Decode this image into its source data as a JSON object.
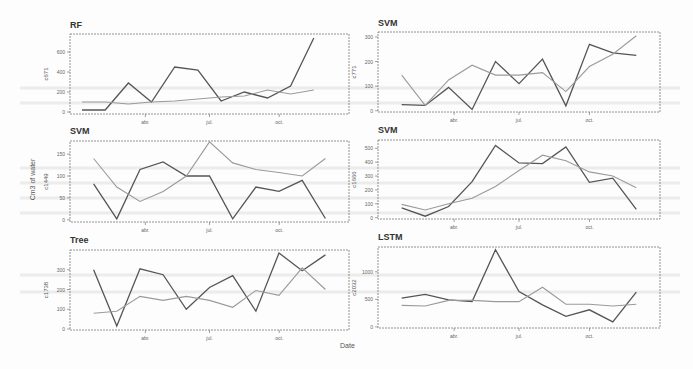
{
  "figure": {
    "xlabel": "Date",
    "ylabel": "Cm3 of water",
    "series_colors": {
      "observed": "#555555",
      "predicted": "#9a9a9a"
    }
  },
  "chart_data": [
    {
      "type": "line",
      "title": "RF",
      "ylabel": "c671",
      "xticks": [
        "abr.",
        "jul.",
        "oct."
      ],
      "yticks": [
        0,
        200,
        400,
        600
      ],
      "ylim": [
        -20,
        780
      ],
      "x": [
        1,
        2,
        3,
        4,
        5,
        6,
        7,
        8,
        9,
        10,
        11,
        12
      ],
      "series": [
        {
          "name": "observed",
          "values": [
            20,
            20,
            290,
            100,
            450,
            420,
            110,
            200,
            140,
            260,
            740,
            null
          ]
        },
        {
          "name": "predicted",
          "values": [
            100,
            100,
            80,
            100,
            110,
            130,
            150,
            160,
            220,
            180,
            220,
            null
          ]
        }
      ]
    },
    {
      "type": "line",
      "title": "SVM",
      "ylabel": "c771",
      "xticks": [
        "abr.",
        "jul.",
        "oct."
      ],
      "yticks": [
        0,
        100,
        200,
        300
      ],
      "ylim": [
        -5,
        320
      ],
      "x": [
        1,
        2,
        3,
        4,
        5,
        6,
        7,
        8,
        9,
        10,
        11,
        12
      ],
      "series": [
        {
          "name": "observed",
          "values": [
            25,
            22,
            95,
            5,
            200,
            110,
            210,
            20,
            270,
            235,
            225
          ]
        },
        {
          "name": "predicted",
          "values": [
            145,
            22,
            125,
            185,
            145,
            145,
            155,
            78,
            180,
            230,
            305
          ]
        }
      ]
    },
    {
      "type": "line",
      "title": "SVM",
      "ylabel": "c1449",
      "xticks": [
        "abr.",
        "jul.",
        "oct."
      ],
      "yticks": [
        0,
        50,
        100,
        150
      ],
      "ylim": [
        -5,
        180
      ],
      "x": [
        1,
        2,
        3,
        4,
        5,
        6,
        7,
        8,
        9,
        10,
        11,
        12
      ],
      "series": [
        {
          "name": "observed",
          "values": [
            82,
            2,
            115,
            132,
            100,
            100,
            2,
            75,
            65,
            90,
            3
          ]
        },
        {
          "name": "predicted",
          "values": [
            140,
            75,
            42,
            65,
            100,
            178,
            130,
            115,
            108,
            100,
            140
          ]
        }
      ]
    },
    {
      "type": "line",
      "title": "SVM",
      "ylabel": "c1666",
      "xticks": [
        "abr.",
        "jul.",
        "oct."
      ],
      "yticks": [
        0,
        100,
        200,
        300,
        400,
        500
      ],
      "ylim": [
        -10,
        560
      ],
      "x": [
        1,
        2,
        3,
        4,
        5,
        6,
        7,
        8,
        9,
        10,
        11,
        12
      ],
      "series": [
        {
          "name": "observed",
          "values": [
            70,
            10,
            80,
            260,
            520,
            395,
            390,
            510,
            255,
            285,
            60
          ]
        },
        {
          "name": "predicted",
          "values": [
            95,
            55,
            100,
            140,
            225,
            340,
            450,
            410,
            330,
            300,
            215
          ]
        }
      ]
    },
    {
      "type": "line",
      "title": "Tree",
      "ylabel": "c1738",
      "xticks": [
        "abr.",
        "jul.",
        "oct."
      ],
      "yticks": [
        0,
        100,
        200,
        300
      ],
      "ylim": [
        -5,
        400
      ],
      "x": [
        1,
        2,
        3,
        4,
        5,
        6,
        7,
        8,
        9,
        10,
        11,
        12
      ],
      "series": [
        {
          "name": "observed",
          "values": [
            300,
            15,
            305,
            275,
            100,
            210,
            270,
            90,
            385,
            295,
            375
          ]
        },
        {
          "name": "predicted",
          "values": [
            80,
            90,
            165,
            145,
            165,
            145,
            110,
            195,
            170,
            310,
            200
          ]
        }
      ]
    },
    {
      "type": "line",
      "title": "LSTM",
      "ylabel": "c2032",
      "xticks": [
        "abr.",
        "jul.",
        "oct."
      ],
      "yticks": [
        0,
        500,
        1000
      ],
      "ylim": [
        -20,
        1450
      ],
      "x": [
        1,
        2,
        3,
        4,
        5,
        6,
        7,
        8,
        9,
        10,
        11,
        12
      ],
      "series": [
        {
          "name": "observed",
          "values": [
            520,
            590,
            490,
            460,
            1400,
            640,
            400,
            190,
            310,
            90,
            630
          ]
        },
        {
          "name": "predicted",
          "values": [
            390,
            380,
            480,
            480,
            460,
            460,
            720,
            410,
            410,
            380,
            410
          ]
        }
      ]
    }
  ]
}
